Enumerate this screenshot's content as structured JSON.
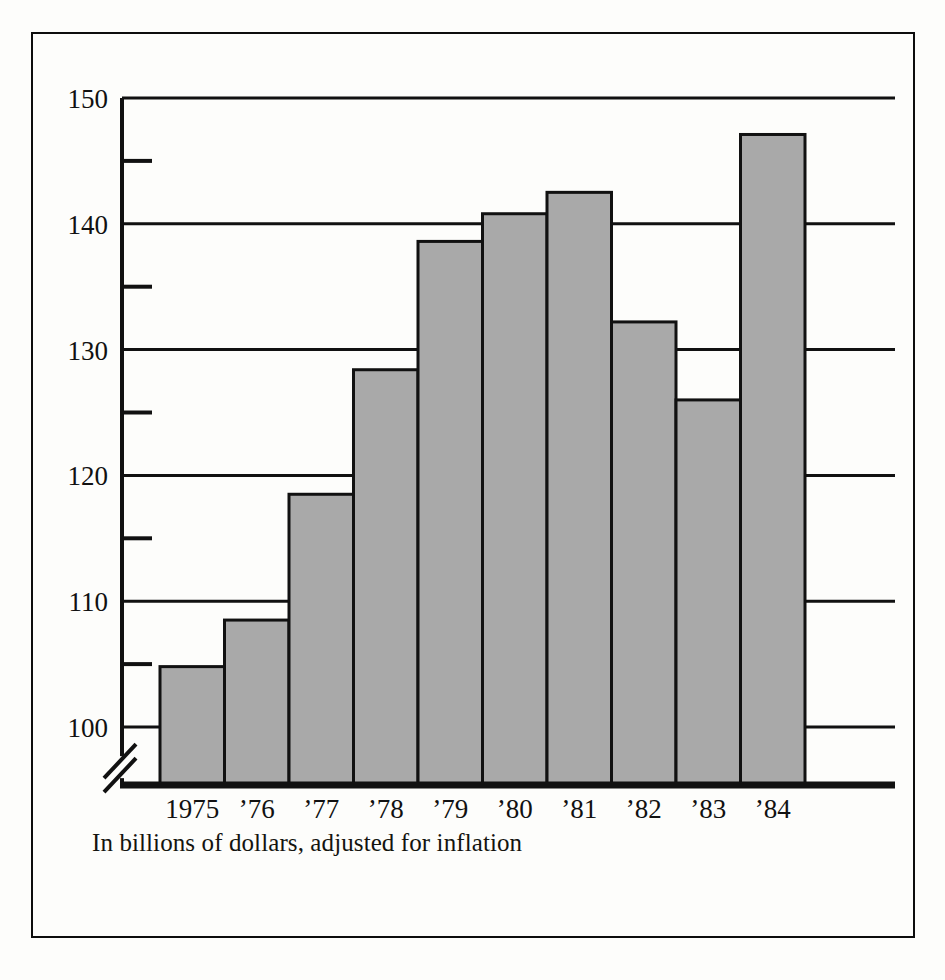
{
  "figure": {
    "caption": "In billions of dollars, adjusted for inflation",
    "frame_color": "#0d0d0d",
    "background_color": "#fdfdfb"
  },
  "chart_data": {
    "type": "bar",
    "title": "",
    "subtitle": "",
    "xlabel": "",
    "ylabel": "",
    "categories": [
      "1975",
      "’76",
      "’77",
      "’78",
      "’79",
      "’80",
      "’81",
      "’82",
      "’83",
      "’84"
    ],
    "values": [
      104.8,
      108.5,
      118.5,
      128.4,
      138.6,
      140.8,
      142.5,
      132.2,
      126.0,
      147.1
    ],
    "ylim": [
      96,
      150
    ],
    "y_major_ticks": [
      100,
      110,
      120,
      130,
      140,
      150
    ],
    "y_major_tick_labels": [
      "100",
      "110",
      "120",
      "130",
      "140",
      "150"
    ],
    "y_minor_ticks": [
      105,
      115,
      125,
      135,
      145
    ],
    "grid": "horizontal-major",
    "legend": "none",
    "axis_break": true,
    "axis_break_value": 98,
    "bar_fill_color": "#a9a9a9",
    "bar_edge_color": "#111111",
    "gridline_color": "#111111",
    "annotation": "In billions of dollars, adjusted for inflation"
  }
}
